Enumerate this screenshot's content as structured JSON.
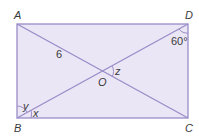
{
  "diagram": {
    "type": "rectangle-with-diagonals",
    "colors": {
      "fill": "#ebe6f6",
      "stroke": "#9a8cc8",
      "text": "#3a3a3a"
    },
    "vertices": {
      "A": {
        "label": "A"
      },
      "B": {
        "label": "B"
      },
      "C": {
        "label": "C"
      },
      "D": {
        "label": "D"
      },
      "O": {
        "label": "O"
      }
    },
    "segment_labels": {
      "AO": "6"
    },
    "angles": {
      "D": "60°",
      "O": "z",
      "B_upper": "y",
      "B_lower": "x"
    }
  }
}
